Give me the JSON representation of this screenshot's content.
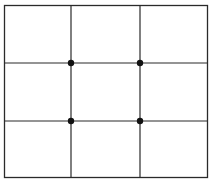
{
  "diagram": {
    "frame": {
      "x": 4,
      "y": 5,
      "width": 204,
      "height": 173
    },
    "vertical_lines_x": [
      71,
      140
    ],
    "horizontal_lines_y": [
      63,
      121
    ],
    "intersection_points": [
      {
        "x": 71,
        "y": 63
      },
      {
        "x": 140,
        "y": 63
      },
      {
        "x": 71,
        "y": 121
      },
      {
        "x": 140,
        "y": 121
      }
    ],
    "colors": {
      "line": "#2a2a2a",
      "dot": "#111111",
      "background": "#ffffff"
    }
  }
}
